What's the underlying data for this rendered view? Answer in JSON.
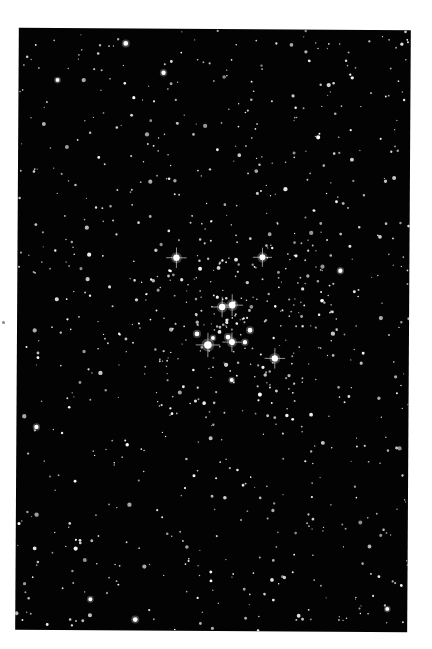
{
  "image": {
    "subject": "Open star cluster field (astronomical photograph)",
    "background_color": "#030303",
    "margin_color": "#ffffff",
    "star_color": "#ffffff",
    "bright_stars": [
      {
        "x": 176,
        "y": 258,
        "r": 3.2,
        "spikes": true
      },
      {
        "x": 262,
        "y": 257,
        "r": 3.0,
        "spikes": true
      },
      {
        "x": 222,
        "y": 307,
        "r": 3.2,
        "spikes": true
      },
      {
        "x": 232,
        "y": 305,
        "r": 3.4,
        "spikes": true
      },
      {
        "x": 208,
        "y": 345,
        "r": 3.8,
        "spikes": true
      },
      {
        "x": 232,
        "y": 342,
        "r": 3.0,
        "spikes": true
      },
      {
        "x": 275,
        "y": 358,
        "r": 3.2,
        "spikes": true
      },
      {
        "x": 197,
        "y": 334,
        "r": 2.4,
        "spikes": false
      },
      {
        "x": 228,
        "y": 337,
        "r": 2.4,
        "spikes": false
      },
      {
        "x": 250,
        "y": 330,
        "r": 2.4,
        "spikes": false
      },
      {
        "x": 245,
        "y": 342,
        "r": 2.2,
        "spikes": false
      },
      {
        "x": 213,
        "y": 338,
        "r": 2.0,
        "spikes": false
      },
      {
        "x": 340,
        "y": 270,
        "r": 2.2,
        "spikes": false
      },
      {
        "x": 232,
        "y": 380,
        "r": 2.0,
        "spikes": false
      },
      {
        "x": 37,
        "y": 428,
        "r": 2.2,
        "spikes": false
      },
      {
        "x": 56,
        "y": 81,
        "r": 2.0,
        "spikes": false
      },
      {
        "x": 124,
        "y": 44,
        "r": 2.4,
        "spikes": false
      },
      {
        "x": 162,
        "y": 73,
        "r": 2.2,
        "spikes": false
      },
      {
        "x": 137,
        "y": 620,
        "r": 2.4,
        "spikes": false
      },
      {
        "x": 92,
        "y": 600,
        "r": 2.0,
        "spikes": false
      },
      {
        "x": 389,
        "y": 608,
        "r": 2.0,
        "spikes": false
      }
    ],
    "field_star_count": 900
  }
}
